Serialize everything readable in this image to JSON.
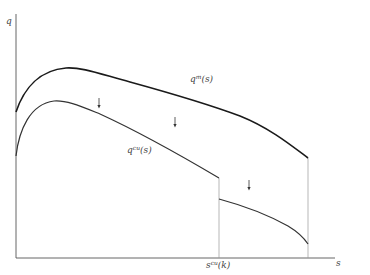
{
  "diagram": {
    "axes": {
      "y_label": "q",
      "x_label": "s",
      "x_tick_label_base": "s",
      "x_tick_label_sup": "cu",
      "x_tick_label_arg": "(k)"
    },
    "curves": [
      {
        "name": "q^m(s)",
        "label_base": "q",
        "label_sup": "m",
        "label_arg": "(s)",
        "style": "thick",
        "color": "#1a1a1a"
      },
      {
        "name": "q^cu(s)",
        "label_base": "q",
        "label_sup": "cu",
        "label_arg": "(s)",
        "style": "medium",
        "color": "#333333",
        "discontinuity_at": "s^cu(k)"
      }
    ],
    "arrows": [
      {
        "direction": "down",
        "x": 99,
        "y": 100
      },
      {
        "direction": "down",
        "x": 175,
        "y": 120
      },
      {
        "direction": "down",
        "x": 249,
        "y": 183
      }
    ],
    "guides": [
      {
        "type": "dotted-vertical",
        "at": "s^cu(k)"
      },
      {
        "type": "dotted-vertical",
        "at": "right end of curves"
      }
    ],
    "colors": {
      "axis": "#555555",
      "guide": "#9a9a9a",
      "curve_upper": "#1a1a1a",
      "curve_lower": "#333333"
    }
  }
}
